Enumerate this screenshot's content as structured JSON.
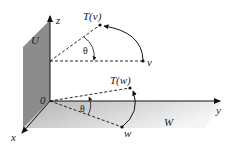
{
  "diagram": {
    "type": "3d-rotation-subspaces",
    "axes": {
      "x_label": "x",
      "y_label": "y",
      "z_label": "z",
      "origin_label": "0"
    },
    "planes": {
      "U": {
        "label": "U",
        "color": "#8c8c8c"
      },
      "W": {
        "label": "W",
        "gradient_from": "#b9b9b9",
        "gradient_to": "#f2f2f2"
      }
    },
    "points": {
      "v": {
        "label": "v"
      },
      "Tv": {
        "label": "T(v)"
      },
      "w": {
        "label": "w"
      },
      "Tw": {
        "label": "T(w)"
      }
    },
    "angles": {
      "upper": "θ",
      "lower": "θ"
    }
  }
}
